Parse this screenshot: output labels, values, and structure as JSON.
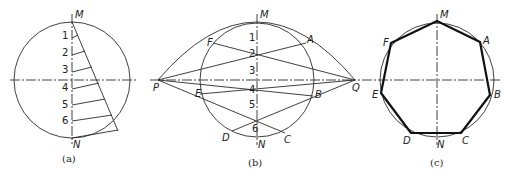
{
  "figure": {
    "panels": [
      {
        "id": "a",
        "caption": "(a)",
        "labels": {
          "top": "M",
          "bottom": "N"
        },
        "division_numbers": [
          "1",
          "2",
          "3",
          "4",
          "5",
          "6"
        ]
      },
      {
        "id": "b",
        "caption": "(b)",
        "labels": {
          "top": "M",
          "bottom": "N",
          "left": "P",
          "right": "Q",
          "A": "A",
          "B": "B",
          "C": "C",
          "D": "D",
          "E": "E",
          "F": "F"
        },
        "division_numbers": [
          "1",
          "2",
          "3",
          "4",
          "5",
          "6"
        ]
      },
      {
        "id": "c",
        "caption": "(c)",
        "labels": {
          "top": "M",
          "bottom": "N",
          "A": "A",
          "B": "B",
          "C": "C",
          "D": "D",
          "E": "E",
          "F": "F"
        }
      }
    ]
  }
}
